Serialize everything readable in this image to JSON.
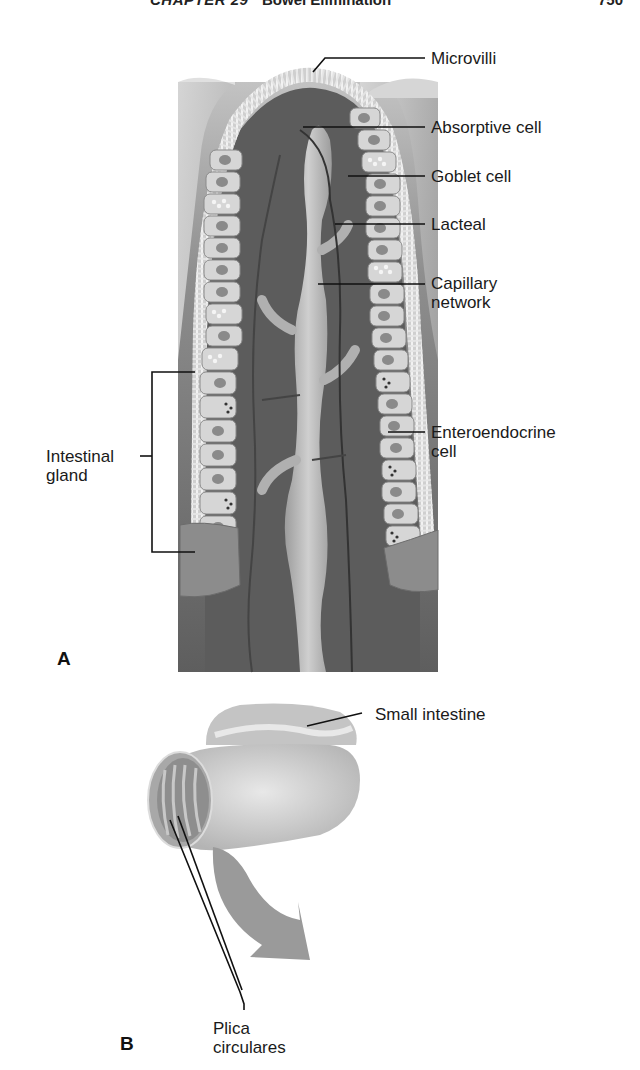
{
  "header": {
    "chapter": "CHAPTER 29",
    "section": "Bowel Elimination",
    "page_number": "750"
  },
  "figure": {
    "panel_a": {
      "letter": "A",
      "labels": {
        "microvilli": "Microvilli",
        "absorptive_cell": "Absorptive cell",
        "goblet_cell": "Goblet cell",
        "lacteal": "Lacteal",
        "capillary_network_line1": "Capillary",
        "capillary_network_line2": "network",
        "enteroendocrine_line1": "Enteroendocrine",
        "enteroendocrine_line2": "cell",
        "intestinal_gland_line1": "Intestinal",
        "intestinal_gland_line2": "gland"
      }
    },
    "panel_b": {
      "letter": "B",
      "labels": {
        "small_intestine": "Small intestine",
        "plica_line1": "Plica",
        "plica_line2": "circulares"
      }
    },
    "colors": {
      "tissue_dark": "#6e6e6e",
      "tissue_light": "#bdbdbd",
      "cell_fill": "#d9d9d9",
      "vessel_fill": "#b0b0b0",
      "leader_line": "#111111",
      "arrow_fill": "#9a9a9a"
    }
  }
}
